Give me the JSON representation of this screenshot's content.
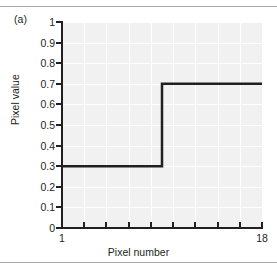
{
  "figure": {
    "panel_label": "(a)",
    "border_color": "#a9a9a9"
  },
  "chart_data": {
    "type": "line",
    "title": "",
    "subtitle": "",
    "xlabel": "Pixel number",
    "ylabel": "Pixel value",
    "xlim": [
      1,
      18
    ],
    "ylim": [
      0,
      1
    ],
    "grid": true,
    "legend": null,
    "plot_background": "#f1f1f1",
    "gridline_color": "#ffffff",
    "line_color": "#231f20",
    "line_width": 2.5,
    "step_style": "post",
    "annotations": [
      "(a)"
    ],
    "x_tick_labels": [
      "1",
      "18"
    ],
    "x_tick_values": [
      1,
      18
    ],
    "x_tick_positions": [
      1,
      2.889,
      4.778,
      6.667,
      8.556,
      10.444,
      12.333,
      14.222,
      16.111,
      18
    ],
    "y_tick_labels": [
      "0",
      "0.1",
      "0.2",
      "0.3",
      "0.4",
      "0.5",
      "0.6",
      "0.7",
      "0.8",
      "0.9",
      "1"
    ],
    "y_tick_values": [
      0,
      0.1,
      0.2,
      0.3,
      0.4,
      0.5,
      0.6,
      0.7,
      0.8,
      0.9,
      1
    ],
    "x": [
      1,
      9.5,
      9.5,
      18
    ],
    "y": [
      0.3,
      0.3,
      0.7,
      0.7
    ],
    "series": [
      {
        "name": "pixel profile",
        "x": [
          1,
          9.5,
          9.5,
          18
        ],
        "values": [
          0.3,
          0.3,
          0.7,
          0.7
        ],
        "description": "step edge from low value 0.3 to high value 0.7 at pixel 9.5"
      }
    ],
    "low_level": 0.3,
    "high_level": 0.7,
    "edge_position": 9.5
  }
}
